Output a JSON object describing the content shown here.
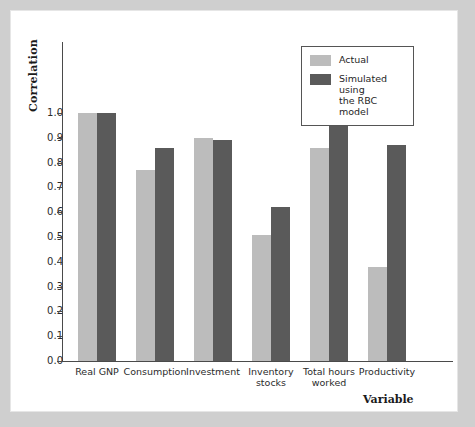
{
  "chart_data": {
    "type": "bar",
    "title": "",
    "xlabel": "Variable",
    "ylabel": "Correlation",
    "ylim": [
      0.0,
      1.0
    ],
    "grid": false,
    "legend_position": "top-right",
    "categories": [
      "Real GNP",
      "Consumption",
      "Investment",
      "Inventory stocks",
      "Total hours worked",
      "Productivity"
    ],
    "category_lines": [
      [
        "Real GNP"
      ],
      [
        "Consumption"
      ],
      [
        "Investment"
      ],
      [
        "Inventory",
        "stocks"
      ],
      [
        "Total hours",
        "worked"
      ],
      [
        "Productivity"
      ]
    ],
    "series": [
      {
        "name": "Actual",
        "color": "#bcbcbc",
        "values": [
          1.0,
          0.77,
          0.9,
          0.51,
          0.86,
          0.38
        ]
      },
      {
        "name": "Simulated using the RBC model",
        "color": "#5a5a5a",
        "values": [
          1.0,
          0.86,
          0.89,
          0.62,
          0.95,
          0.87
        ]
      }
    ],
    "ytick_labels": [
      "1.0",
      "0.9",
      "0.8",
      "0.7",
      "0.6",
      "0.5",
      "0.4",
      "0.3",
      "0.2",
      "0.1",
      "0.0"
    ],
    "ytick_values": [
      1.0,
      0.9,
      0.8,
      0.7,
      0.6,
      0.5,
      0.4,
      0.3,
      0.2,
      0.1,
      0.0
    ]
  },
  "legend": {
    "entries": [
      {
        "label": "Actual",
        "label_line2": ""
      },
      {
        "label": "Simulated using",
        "label_line2": "the RBC model"
      }
    ]
  },
  "colors": {
    "actual": "#bcbcbc",
    "simulated": "#5a5a5a",
    "axis": "#4a4a4a",
    "page_background": "#cfcfcf",
    "panel_background": "#ffffff"
  }
}
